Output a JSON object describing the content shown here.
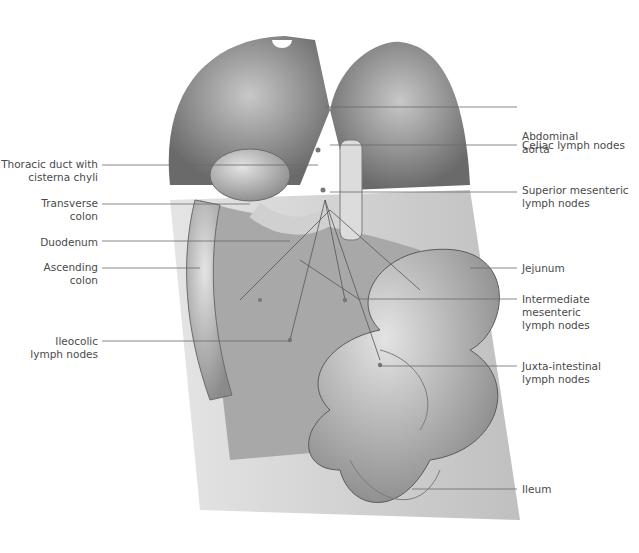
{
  "figure": {
    "labels_left": [
      {
        "text": "Thoracic duct with\ncisterna chyli",
        "x": 30,
        "y": 158,
        "lineY": 165,
        "lx1": 102,
        "lx2": 318
      },
      {
        "text": "Transverse\ncolon",
        "x": 30,
        "y": 197,
        "lineY": 204,
        "lx1": 102,
        "lx2": 250
      },
      {
        "text": "Duodenum",
        "x": 30,
        "y": 236,
        "lineY": 241,
        "lx1": 102,
        "lx2": 290
      },
      {
        "text": "Ascending\ncolon",
        "x": 30,
        "y": 261,
        "lineY": 268,
        "lx1": 102,
        "lx2": 200
      },
      {
        "text": "Ileocolic\nlymph nodes",
        "x": 30,
        "y": 335,
        "lineY": 341,
        "lx1": 102,
        "lx2": 290
      }
    ],
    "labels_right": [
      {
        "text": "Abdominal\naorta",
        "x": 522,
        "y": 130,
        "lineY": 107,
        "lx1": 325,
        "lx2": 517
      },
      {
        "text": "Celiac lymph nodes",
        "x": 522,
        "y": 139,
        "lineY": 145,
        "lx1": 330,
        "lx2": 517
      },
      {
        "text": "Superior mesenteric\nlymph nodes",
        "x": 522,
        "y": 184,
        "lineY": 192,
        "lx1": 330,
        "lx2": 517
      },
      {
        "text": "Jejunum",
        "x": 522,
        "y": 262,
        "lineY": 268,
        "lx1": 470,
        "lx2": 517
      },
      {
        "text": "Intermediate\nmesenteric\nlymph nodes",
        "x": 522,
        "y": 293,
        "lineY": 299,
        "lx1": 360,
        "lx2": 517
      },
      {
        "text": "Juxta-intestinal\nlymph nodes",
        "x": 522,
        "y": 360,
        "lineY": 366,
        "lx1": 380,
        "lx2": 517
      },
      {
        "text": "Ileum",
        "x": 522,
        "y": 483,
        "lineY": 489,
        "lx1": 412,
        "lx2": 517
      }
    ],
    "colors": {
      "line": "#6a6a6a",
      "text": "#4a4a4a",
      "tissue_dark": "#5a5a5a",
      "tissue_mid": "#9a9a9a",
      "tissue_light": "#d8d8d8"
    }
  }
}
